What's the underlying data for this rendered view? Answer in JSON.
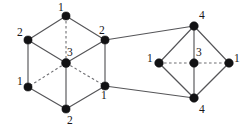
{
  "figure": {
    "width": 249,
    "height": 130,
    "background_color": "#ffffff",
    "edge_color": "#555558",
    "dashed_edge_color": "#6e6e72",
    "vertex_color": "#121214",
    "label_color": "#17171a"
  },
  "graphs": [
    {
      "name": "left-hexagon-graph",
      "shape": "hexagonal-prism-projection",
      "vertices": [
        {
          "id": "L-top",
          "label": "1",
          "x": 66,
          "y": 16,
          "r": 4.1,
          "label_x": 58,
          "label_y": 11
        },
        {
          "id": "L-upper-left",
          "label": "2",
          "x": 28,
          "y": 40,
          "r": 4.1,
          "label_x": 17,
          "label_y": 36
        },
        {
          "id": "L-upper-right",
          "label": "2",
          "x": 105,
          "y": 40,
          "r": 4.1,
          "label_x": 99,
          "label_y": 34
        },
        {
          "id": "L-center",
          "label": "3",
          "x": 66,
          "y": 63,
          "r": 4.5,
          "label_x": 67,
          "label_y": 56
        },
        {
          "id": "L-lower-left",
          "label": "1",
          "x": 28,
          "y": 87,
          "r": 4.1,
          "label_x": 17,
          "label_y": 85
        },
        {
          "id": "L-lower-right",
          "label": "1",
          "x": 105,
          "y": 86,
          "r": 4.1,
          "label_x": 101,
          "label_y": 99
        },
        {
          "id": "L-bottom",
          "label": "2",
          "x": 66,
          "y": 109,
          "r": 4.1,
          "label_x": 67,
          "label_y": 124
        }
      ],
      "edges": [
        {
          "from": "L-top",
          "to": "L-upper-left",
          "style": "solid"
        },
        {
          "from": "L-top",
          "to": "L-upper-right",
          "style": "solid"
        },
        {
          "from": "L-top",
          "to": "L-center",
          "style": "dashed"
        },
        {
          "from": "L-upper-left",
          "to": "L-center",
          "style": "solid"
        },
        {
          "from": "L-upper-right",
          "to": "L-center",
          "style": "solid"
        },
        {
          "from": "L-upper-left",
          "to": "L-lower-left",
          "style": "solid"
        },
        {
          "from": "L-upper-right",
          "to": "L-lower-right",
          "style": "solid"
        },
        {
          "from": "L-center",
          "to": "L-lower-left",
          "style": "dashed"
        },
        {
          "from": "L-center",
          "to": "L-lower-right",
          "style": "dashed"
        },
        {
          "from": "L-center",
          "to": "L-bottom",
          "style": "solid"
        },
        {
          "from": "L-lower-left",
          "to": "L-bottom",
          "style": "solid"
        },
        {
          "from": "L-lower-right",
          "to": "L-bottom",
          "style": "solid"
        }
      ]
    },
    {
      "name": "right-diamond-graph",
      "shape": "octahedron-projection",
      "vertices": [
        {
          "id": "R-top",
          "label": "4",
          "x": 194,
          "y": 26,
          "r": 4.3,
          "label_x": 199,
          "label_y": 19
        },
        {
          "id": "R-left",
          "label": "1",
          "x": 159,
          "y": 63,
          "r": 4.3,
          "label_x": 147,
          "label_y": 62
        },
        {
          "id": "R-center",
          "label": "3",
          "x": 194,
          "y": 63,
          "r": 4.3,
          "label_x": 196,
          "label_y": 56
        },
        {
          "id": "R-right",
          "label": "1",
          "x": 229,
          "y": 63,
          "r": 4.3,
          "label_x": 234,
          "label_y": 62
        },
        {
          "id": "R-bottom",
          "label": "4",
          "x": 194,
          "y": 98,
          "r": 4.3,
          "label_x": 199,
          "label_y": 113
        }
      ],
      "edges": [
        {
          "from": "R-top",
          "to": "R-left",
          "style": "solid"
        },
        {
          "from": "R-top",
          "to": "R-right",
          "style": "solid"
        },
        {
          "from": "R-top",
          "to": "R-center",
          "style": "solid"
        },
        {
          "from": "R-left",
          "to": "R-bottom",
          "style": "solid"
        },
        {
          "from": "R-right",
          "to": "R-bottom",
          "style": "solid"
        },
        {
          "from": "R-center",
          "to": "R-bottom",
          "style": "solid"
        },
        {
          "from": "R-left",
          "to": "R-center",
          "style": "dashed"
        },
        {
          "from": "R-center",
          "to": "R-right",
          "style": "dashed"
        }
      ]
    }
  ],
  "connector_edges": [
    {
      "name": "upper-connector",
      "from": "L-upper-right",
      "to": "R-top",
      "style": "solid"
    },
    {
      "name": "lower-connector",
      "from": "L-lower-right",
      "to": "R-bottom",
      "style": "solid"
    }
  ],
  "chart_data": {
    "type": "diagram",
    "title": "",
    "node_labels": [
      "1",
      "2",
      "2",
      "3",
      "1",
      "1",
      "2",
      "4",
      "1",
      "3",
      "1",
      "4"
    ],
    "left_component_labels": [
      "1",
      "2",
      "2",
      "3",
      "1",
      "1",
      "2"
    ],
    "right_component_labels": [
      "4",
      "1",
      "3",
      "1",
      "4"
    ],
    "node_count": 12,
    "edge_count": 22
  }
}
